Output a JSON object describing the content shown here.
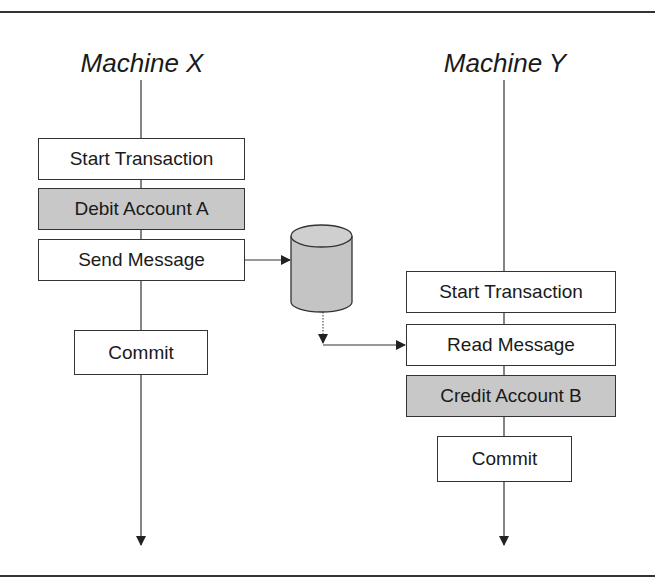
{
  "diagram": {
    "machines": [
      {
        "title": "Machine X",
        "steps": [
          {
            "label": "Start Transaction",
            "shaded": false
          },
          {
            "label": "Debit Account A",
            "shaded": true
          },
          {
            "label": "Send Message",
            "shaded": false
          },
          {
            "label": "Commit",
            "shaded": false
          }
        ]
      },
      {
        "title": "Machine Y",
        "steps": [
          {
            "label": "Start Transaction",
            "shaded": false
          },
          {
            "label": "Read Message",
            "shaded": false
          },
          {
            "label": "Credit Account B",
            "shaded": true
          },
          {
            "label": "Commit",
            "shaded": false
          }
        ]
      }
    ],
    "queue": {
      "icon": "database-cylinder-icon"
    },
    "colors": {
      "line": "#333333",
      "shaded_fill": "#c8c8c8",
      "background": "#ffffff"
    }
  }
}
